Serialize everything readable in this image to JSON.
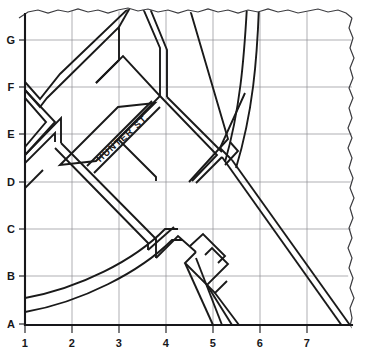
{
  "map": {
    "title": "Hunter St. area street map",
    "medium": "hand-drawn line map on torn paper",
    "colors": {
      "paper": "#ffffff",
      "road_outline": "#1a1a1a",
      "grid_line": "#8d8d93",
      "axis_line": "#17171a",
      "label_text": "#17171a",
      "torn_edge": "#3b3b3f"
    },
    "grid": {
      "row_labels": [
        "G",
        "F",
        "E",
        "D",
        "C",
        "B",
        "A"
      ],
      "column_labels": [
        "1",
        "2",
        "3",
        "4",
        "5",
        "6",
        "7"
      ],
      "row_label_y": [
        40,
        87,
        134,
        182,
        229,
        276,
        324
      ],
      "column_label_x": [
        25,
        72,
        119,
        166,
        213,
        260,
        307
      ],
      "spacing_px": 47,
      "origin_label": "A1",
      "grid_visible": true
    },
    "axes": {
      "left_axis_name": "row-axis",
      "bottom_axis_name": "column-axis",
      "bottom_label_baseline_y": 347,
      "left_label_x": 11
    },
    "street_labels": [
      {
        "name": "hunter-street",
        "text": "HUNTER  ST.",
        "x": 125,
        "y": 140,
        "rotation_deg": -42,
        "grid_ref": "E3"
      }
    ],
    "features": {
      "torn_edges": [
        "top",
        "right"
      ],
      "curved_roads": 2,
      "diagonal_roads": "multiple",
      "notes": "Double-line roads drawn as parallel outlines"
    }
  }
}
